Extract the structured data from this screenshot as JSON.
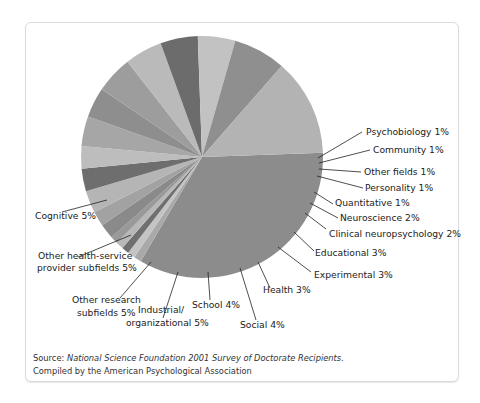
{
  "chart_data": {
    "type": "pie",
    "title": "",
    "slices": [
      {
        "label": "",
        "value": 34,
        "color": "#8c8c8c",
        "labeled": false
      },
      {
        "label": "Psychobiology 1%",
        "value": 1,
        "color": "#a9a9a9"
      },
      {
        "label": "Community 1%",
        "value": 1,
        "color": "#c4c4c4"
      },
      {
        "label": "Other fields 1%",
        "value": 1,
        "color": "#6f6f6f"
      },
      {
        "label": "Personality 1%",
        "value": 1,
        "color": "#b8b8b8"
      },
      {
        "label": "Quantitative 1%",
        "value": 1,
        "color": "#999999"
      },
      {
        "label": "Neuroscience 2%",
        "value": 2,
        "color": "#8a8a8a"
      },
      {
        "label": "Clinical neuropsychology 2%",
        "value": 2,
        "color": "#a2a2a2"
      },
      {
        "label": "Educational 3%",
        "value": 3,
        "color": "#b5b5b5"
      },
      {
        "label": "Experimental 3%",
        "value": 3,
        "color": "#6e6e6e"
      },
      {
        "label": "Health 3%",
        "value": 3,
        "color": "#bdbdbd"
      },
      {
        "label": "Social 4%",
        "value": 4,
        "color": "#a6a6a6"
      },
      {
        "label": "School 4%",
        "value": 4,
        "color": "#8e8e8e"
      },
      {
        "label": "Industrial/ organizational 5%",
        "value": 5,
        "color": "#9d9d9d"
      },
      {
        "label": "Other research subfields 5%",
        "value": 5,
        "color": "#bababa"
      },
      {
        "label": "Other health-service provider subfields 5%",
        "value": 5,
        "color": "#6c6c6c"
      },
      {
        "label": "Cognitive 5%",
        "value": 5,
        "color": "#c2c2c2"
      },
      {
        "label": "",
        "value": 7,
        "color": "#8f8f8f",
        "labeled": false
      },
      {
        "label": "",
        "value": 13,
        "color": "#b3b3b3",
        "labeled": false
      }
    ],
    "start_angle_deg": 2,
    "direction": "clockwise",
    "legend": "none (leader-line labels)"
  },
  "labels": {
    "psychobiology": "Psychobiology 1%",
    "community": "Community 1%",
    "other_fields": "Other fields 1%",
    "personality": "Personality 1%",
    "quantitative": "Quantitative 1%",
    "neuroscience": "Neuroscience 2%",
    "clinical_neuro": "Clinical neuropsychology 2%",
    "educational": "Educational 3%",
    "experimental": "Experimental 3%",
    "health": "Health 3%",
    "social": "Social 4%",
    "school": "School 4%",
    "industrial_1": "Industrial/",
    "industrial_2": "organizational 5%",
    "other_research_1": "Other research",
    "other_research_2": "subfields 5%",
    "other_hsp_1": "Other health-service",
    "other_hsp_2": "provider subfields 5%",
    "cognitive": "Cognitive 5%"
  },
  "source": {
    "prefix": "Source: ",
    "title": "National Science Foundation 2001 Survey of Doctorate Recipients.",
    "line2": "Compiled by the American Psychological Association"
  }
}
